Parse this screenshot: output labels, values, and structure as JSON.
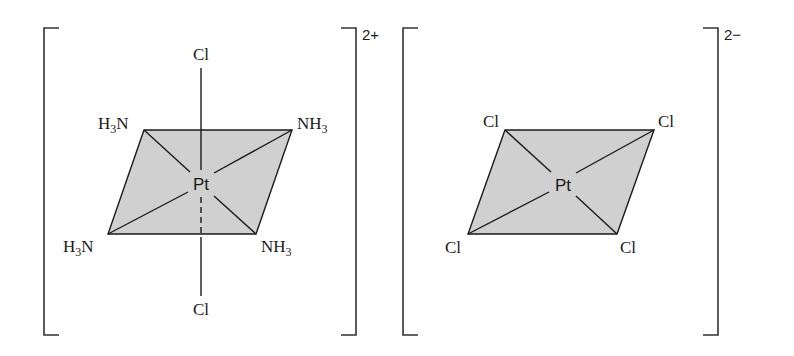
{
  "figure": {
    "colors": {
      "plane_fill": "#d0d0d0",
      "ink": "#1a1a1a"
    }
  },
  "cation": {
    "charge": "2+",
    "center": {
      "symbol": "Pt"
    },
    "axial": {
      "top": "Cl",
      "bottom": "Cl"
    },
    "ligands": {
      "top_left": {
        "main": "H",
        "sub": "3",
        "tail": "N"
      },
      "top_right": {
        "main": "NH",
        "sub": "3",
        "tail": ""
      },
      "bottom_left": {
        "main": "H",
        "sub": "3",
        "tail": "N"
      },
      "bottom_right": {
        "main": "NH",
        "sub": "3",
        "tail": ""
      }
    }
  },
  "anion": {
    "charge": "2−",
    "center": {
      "symbol": "Pt"
    },
    "ligands": {
      "top_left": "Cl",
      "top_right": "Cl",
      "bottom_left": "Cl",
      "bottom_right": "Cl"
    }
  }
}
